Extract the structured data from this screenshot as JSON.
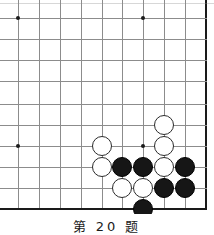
{
  "figure": {
    "type": "go-board-diagram",
    "caption": "第 20 题",
    "board_width_px": 214,
    "board_height_px": 214
  },
  "board": {
    "line_color": "#8c8c8c",
    "edge_color": "#1a1a1a",
    "background_color": "#ffffff",
    "spacing_px": 20.9,
    "vertical_lines_x": [
      18,
      39,
      60,
      81,
      102,
      122,
      143,
      164,
      185,
      206
    ],
    "horizontal_lines_y": [
      18,
      39,
      60,
      81,
      104,
      125,
      146,
      167,
      188,
      209
    ],
    "top_partial_line_y": 3,
    "right_edge_x": 206,
    "bottom_edge_y": 209,
    "star_points": [
      {
        "x": 18,
        "y": 18
      },
      {
        "x": 143,
        "y": 18
      },
      {
        "x": 18,
        "y": 146
      },
      {
        "x": 143,
        "y": 146
      }
    ]
  },
  "stones": {
    "black_color": "#161616",
    "white_color": "#ffffff",
    "radius_px": 10,
    "items": [
      {
        "color": "white",
        "x": 164,
        "y": 125
      },
      {
        "color": "white",
        "x": 102,
        "y": 146
      },
      {
        "color": "white",
        "x": 164,
        "y": 146
      },
      {
        "color": "white",
        "x": 102,
        "y": 167
      },
      {
        "color": "black",
        "x": 122,
        "y": 167
      },
      {
        "color": "black",
        "x": 143,
        "y": 167
      },
      {
        "color": "white",
        "x": 164,
        "y": 167
      },
      {
        "color": "black",
        "x": 185,
        "y": 167
      },
      {
        "color": "white",
        "x": 122,
        "y": 188
      },
      {
        "color": "white",
        "x": 143,
        "y": 188
      },
      {
        "color": "black",
        "x": 164,
        "y": 188
      },
      {
        "color": "black",
        "x": 185,
        "y": 188
      },
      {
        "color": "black",
        "x": 143,
        "y": 209
      }
    ]
  }
}
